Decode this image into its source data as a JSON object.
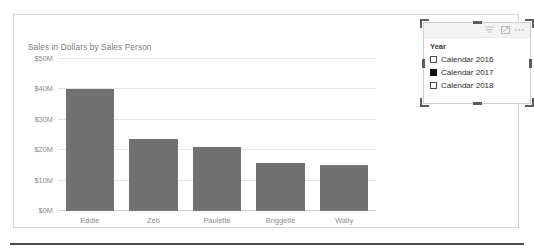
{
  "chart_data": {
    "type": "bar",
    "title": "Sales in Dollars by Sales Person",
    "xlabel": "",
    "ylabel": "",
    "categories": [
      "Eddie",
      "Zeb",
      "Paulette",
      "Briggette",
      "Wally"
    ],
    "values": [
      40.1,
      23.8,
      21.2,
      15.7,
      15.2
    ],
    "ytick_labels": [
      "$50M",
      "$40M",
      "$30M",
      "$20M",
      "$10M",
      "$0M"
    ],
    "ytick_values": [
      50,
      40,
      30,
      20,
      10,
      0
    ],
    "ylim": [
      0,
      50
    ],
    "grid": true,
    "legend": "none",
    "bar_color": "#717171",
    "gridline_color": "#e4e4e4",
    "tick_label_color": "#8a8a8a",
    "title_color": "#7b7b7b"
  },
  "slicer": {
    "title": "Year",
    "header_icons": [
      {
        "name": "filter-icon",
        "label": "Filter"
      },
      {
        "name": "focus-mode-icon",
        "label": "Focus mode"
      },
      {
        "name": "more-options-icon",
        "label": "More options"
      }
    ],
    "items": [
      {
        "label": "Calendar 2016",
        "checked": false
      },
      {
        "label": "Calendar 2017",
        "checked": true
      },
      {
        "label": "Calendar 2018",
        "checked": false
      }
    ],
    "selected": true
  }
}
